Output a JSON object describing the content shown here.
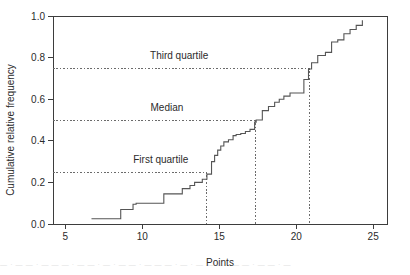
{
  "chart_data": {
    "type": "line",
    "title": "",
    "subtitle": "",
    "xlabel": "Points",
    "ylabel": "Cumulative relative frequency",
    "xlim": [
      4.2,
      25.9
    ],
    "ylim": [
      0.0,
      1.0
    ],
    "grid": false,
    "legend": "none",
    "x_ticks": [
      5,
      10,
      15,
      20,
      25
    ],
    "x_tick_labels": [
      "5",
      "10",
      "15",
      "20",
      "25"
    ],
    "y_ticks": [
      0.0,
      0.2,
      0.4,
      0.6,
      0.8,
      1.0
    ],
    "y_tick_labels": [
      "0.0",
      "0.2",
      "0.4",
      "0.6",
      "0.8",
      "1.0"
    ],
    "series_name": "Cumulative relative frequency of points",
    "x": [
      6.7,
      8.5,
      8.6,
      9.4,
      9.6,
      11.3,
      11.4,
      12.6,
      13.1,
      13.4,
      13.9,
      14.2,
      14.5,
      14.7,
      14.9,
      15.1,
      15.3,
      15.6,
      15.9,
      16.1,
      16.4,
      16.7,
      17.0,
      17.3,
      17.4,
      17.8,
      18.2,
      18.6,
      18.9,
      19.2,
      19.6,
      20.1,
      20.5,
      20.8,
      21.0,
      21.4,
      21.9,
      22.3,
      22.7,
      23.1,
      23.5,
      23.9,
      24.3
    ],
    "y": [
      0.025,
      0.025,
      0.07,
      0.095,
      0.1,
      0.1,
      0.145,
      0.17,
      0.185,
      0.2,
      0.215,
      0.24,
      0.3,
      0.33,
      0.355,
      0.375,
      0.395,
      0.405,
      0.425,
      0.43,
      0.435,
      0.445,
      0.455,
      0.49,
      0.5,
      0.545,
      0.565,
      0.585,
      0.6,
      0.615,
      0.63,
      0.63,
      0.695,
      0.745,
      0.775,
      0.81,
      0.825,
      0.875,
      0.885,
      0.915,
      0.935,
      0.955,
      0.98
    ],
    "annotations": [
      {
        "name": "third-quartile",
        "label": "Third quartile",
        "y_value": 0.75,
        "x_value": 20.85,
        "label_x": 12.4,
        "label_y": 0.795
      },
      {
        "name": "median",
        "label": "Median",
        "y_value": 0.5,
        "x_value": 17.35,
        "label_x": 11.6,
        "label_y": 0.545
      },
      {
        "name": "first-quartile",
        "label": "First quartile",
        "y_value": 0.25,
        "x_value": 14.2,
        "label_x": 11.2,
        "label_y": 0.295
      }
    ]
  },
  "colors": {
    "step_line": "#555555",
    "axis": "#3d3d3d",
    "guide": "#6b6b6b",
    "text": "#2b2b2b",
    "background": "#ffffff"
  },
  "footer": {
    "smudge_text": "— · — — · — — — · — — · — · — — · — — — · — · — — — · — — · — — · —"
  }
}
